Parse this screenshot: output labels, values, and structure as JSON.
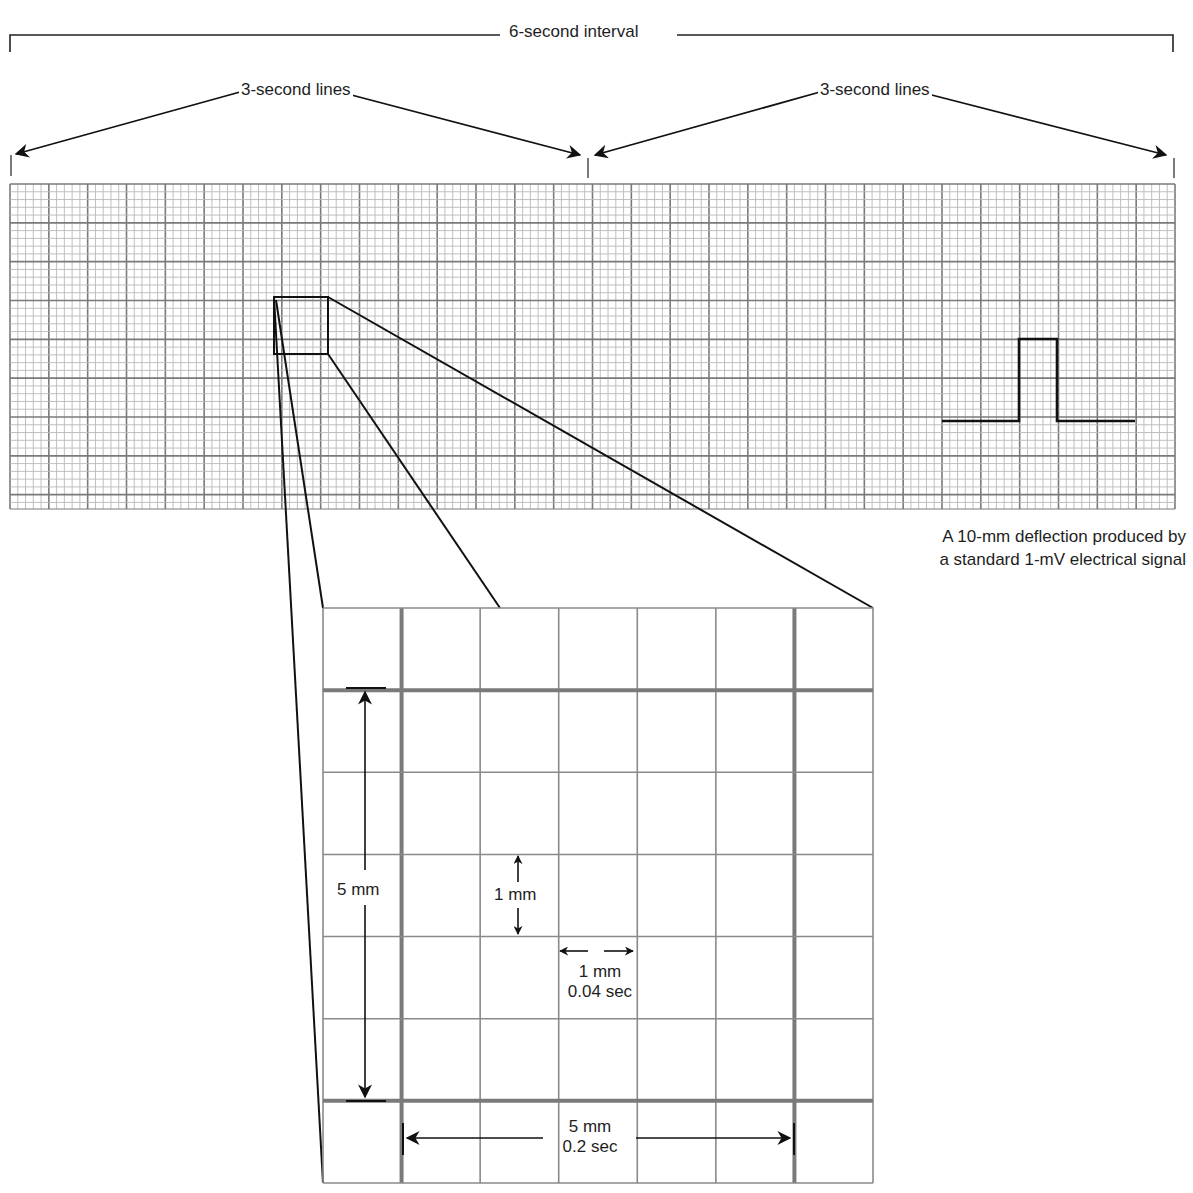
{
  "labels": {
    "six_second_interval": "6-second interval",
    "three_second_left": "3-second lines",
    "three_second_right": "3-second lines",
    "calibration_line1": "A 10-mm deflection produced by",
    "calibration_line2": "a standard 1-mV electrical signal",
    "inset_vertical_5mm": "5 mm",
    "inset_vertical_1mm": "1 mm",
    "inset_horizontal_1mm": "1 mm",
    "inset_horizontal_1mm_time": "0.04 sec",
    "inset_horizontal_5mm": "5 mm",
    "inset_horizontal_5mm_time": "0.2 sec"
  },
  "strip": {
    "x": 10,
    "y": 184,
    "width": 1165,
    "height": 325,
    "small_box_px": 7.77,
    "small_per_large": 5,
    "large_boxes_horizontal": 30,
    "small_line_color": "#b9b9b9",
    "large_line_color": "#7a7a7a"
  },
  "calibration_pulse": {
    "baseline_y": 421,
    "top_y": 339,
    "x_start": 942,
    "x_rise": 1019,
    "x_fall": 1057,
    "x_end": 1135,
    "height_mm": 10,
    "signal_mV": 1
  },
  "inset": {
    "x": 323,
    "y": 608,
    "width": 550,
    "height": 575,
    "columns": 7,
    "rows": 7,
    "thick_col_indices": [
      1,
      6
    ],
    "thick_row_indices": [
      1,
      6
    ],
    "thin_line_color": "#8a8a8a",
    "thick_line_color": "#7a7a7a"
  },
  "zoom_box": {
    "x": 274,
    "y": 297,
    "width": 54,
    "height": 57
  },
  "colors": {
    "ink": "#111111",
    "background": "#ffffff"
  }
}
